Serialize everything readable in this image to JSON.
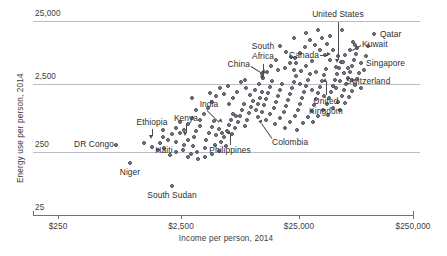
{
  "chart_data": {
    "type": "scatter",
    "title": "",
    "xlabel": "Income per person, 2014",
    "ylabel": "Energy use per person, 2014",
    "xscale": "log",
    "yscale": "log",
    "xlim": [
      250,
      250000
    ],
    "ylim": [
      25,
      25000
    ],
    "xticks": [
      "$250",
      "$2,500",
      "$25,000",
      "$250,000"
    ],
    "xtick_values": [
      250,
      2500,
      25000,
      250000
    ],
    "yticks": [
      "25",
      "250",
      "2,500",
      "25,000"
    ],
    "ytick_values": [
      25,
      250,
      2500,
      25000
    ],
    "grid": "horizontal",
    "legend": "none",
    "annotations": [
      {
        "label": "United States",
        "x": 52000,
        "y": 6800
      },
      {
        "label": "Qatar",
        "x": 130000,
        "y": 15000
      },
      {
        "label": "Kuwait",
        "x": 78000,
        "y": 9500
      },
      {
        "label": "Canada",
        "x": 43000,
        "y": 7600
      },
      {
        "label": "Singapore",
        "x": 82000,
        "y": 5000
      },
      {
        "label": "Switzerland",
        "x": 57000,
        "y": 2700
      },
      {
        "label": "South Africa",
        "x": 12500,
        "y": 2700
      },
      {
        "label": "China",
        "x": 12500,
        "y": 2200
      },
      {
        "label": "United Kingdom",
        "x": 38000,
        "y": 2900
      },
      {
        "label": "India",
        "x": 5400,
        "y": 640
      },
      {
        "label": "Ethiopia",
        "x": 1400,
        "y": 480
      },
      {
        "label": "Kenya",
        "x": 2700,
        "y": 500
      },
      {
        "label": "DR Congo",
        "x": 700,
        "y": 290
      },
      {
        "label": "Haiti",
        "x": 1650,
        "y": 390
      },
      {
        "label": "Philippines",
        "x": 6500,
        "y": 470
      },
      {
        "label": "Colombia",
        "x": 12500,
        "y": 720
      },
      {
        "label": "Niger",
        "x": 900,
        "y": 150
      },
      {
        "label": "South Sudan",
        "x": 2100,
        "y": 70
      }
    ],
    "points": [
      {
        "px": 130,
        "py": 163
      },
      {
        "px": 172,
        "py": 186
      },
      {
        "px": 116,
        "py": 145
      },
      {
        "px": 144,
        "py": 143
      },
      {
        "px": 160,
        "py": 143
      },
      {
        "px": 163,
        "py": 137
      },
      {
        "px": 163,
        "py": 130
      },
      {
        "px": 152,
        "py": 147
      },
      {
        "px": 176,
        "py": 142
      },
      {
        "px": 180,
        "py": 133
      },
      {
        "px": 188,
        "py": 140
      },
      {
        "px": 193,
        "py": 146
      },
      {
        "px": 194,
        "py": 137
      },
      {
        "px": 196,
        "py": 131
      },
      {
        "px": 200,
        "py": 126
      },
      {
        "px": 183,
        "py": 150
      },
      {
        "px": 176,
        "py": 152
      },
      {
        "px": 170,
        "py": 155
      },
      {
        "px": 188,
        "py": 157
      },
      {
        "px": 197,
        "py": 152
      },
      {
        "px": 205,
        "py": 148
      },
      {
        "px": 206,
        "py": 140
      },
      {
        "px": 209,
        "py": 133
      },
      {
        "px": 212,
        "py": 127
      },
      {
        "px": 214,
        "py": 121
      },
      {
        "px": 216,
        "py": 135
      },
      {
        "px": 219,
        "py": 129
      },
      {
        "px": 221,
        "py": 142
      },
      {
        "px": 224,
        "py": 137
      },
      {
        "px": 227,
        "py": 131
      },
      {
        "px": 229,
        "py": 125
      },
      {
        "px": 231,
        "py": 120
      },
      {
        "px": 233,
        "py": 114
      },
      {
        "px": 235,
        "py": 128
      },
      {
        "px": 238,
        "py": 122
      },
      {
        "px": 240,
        "py": 116
      },
      {
        "px": 242,
        "py": 110
      },
      {
        "px": 245,
        "py": 126
      },
      {
        "px": 247,
        "py": 120
      },
      {
        "px": 249,
        "py": 113
      },
      {
        "px": 251,
        "py": 107
      },
      {
        "px": 253,
        "py": 101
      },
      {
        "px": 232,
        "py": 134
      },
      {
        "px": 226,
        "py": 146
      },
      {
        "px": 219,
        "py": 151
      },
      {
        "px": 212,
        "py": 154
      },
      {
        "px": 205,
        "py": 157
      },
      {
        "px": 198,
        "py": 159
      },
      {
        "px": 191,
        "py": 154
      },
      {
        "px": 184,
        "py": 145
      },
      {
        "px": 215,
        "py": 145
      },
      {
        "px": 222,
        "py": 133
      },
      {
        "px": 236,
        "py": 116
      },
      {
        "px": 244,
        "py": 104
      },
      {
        "px": 256,
        "py": 110
      },
      {
        "px": 258,
        "py": 104
      },
      {
        "px": 260,
        "py": 98
      },
      {
        "px": 262,
        "py": 92
      },
      {
        "px": 264,
        "py": 105
      },
      {
        "px": 266,
        "py": 99
      },
      {
        "px": 268,
        "py": 93
      },
      {
        "px": 270,
        "py": 87
      },
      {
        "px": 272,
        "py": 81
      },
      {
        "px": 258,
        "py": 117
      },
      {
        "px": 262,
        "py": 112
      },
      {
        "px": 266,
        "py": 120
      },
      {
        "px": 270,
        "py": 114
      },
      {
        "px": 274,
        "py": 108
      },
      {
        "px": 276,
        "py": 102
      },
      {
        "px": 278,
        "py": 96
      },
      {
        "px": 280,
        "py": 90
      },
      {
        "px": 282,
        "py": 84
      },
      {
        "px": 275,
        "py": 124
      },
      {
        "px": 280,
        "py": 118
      },
      {
        "px": 284,
        "py": 112
      },
      {
        "px": 286,
        "py": 106
      },
      {
        "px": 288,
        "py": 100
      },
      {
        "px": 290,
        "py": 94
      },
      {
        "px": 292,
        "py": 88
      },
      {
        "px": 294,
        "py": 82
      },
      {
        "px": 296,
        "py": 76
      },
      {
        "px": 285,
        "py": 128
      },
      {
        "px": 290,
        "py": 122
      },
      {
        "px": 295,
        "py": 116
      },
      {
        "px": 298,
        "py": 110
      },
      {
        "px": 300,
        "py": 104
      },
      {
        "px": 302,
        "py": 98
      },
      {
        "px": 304,
        "py": 92
      },
      {
        "px": 306,
        "py": 86
      },
      {
        "px": 308,
        "py": 80
      },
      {
        "px": 310,
        "py": 74
      },
      {
        "px": 297,
        "py": 130
      },
      {
        "px": 303,
        "py": 123
      },
      {
        "px": 308,
        "py": 117
      },
      {
        "px": 312,
        "py": 111
      },
      {
        "px": 314,
        "py": 105
      },
      {
        "px": 316,
        "py": 99
      },
      {
        "px": 318,
        "py": 93
      },
      {
        "px": 320,
        "py": 87
      },
      {
        "px": 322,
        "py": 81
      },
      {
        "px": 324,
        "py": 75
      },
      {
        "px": 326,
        "py": 69
      },
      {
        "px": 313,
        "py": 122
      },
      {
        "px": 318,
        "py": 116
      },
      {
        "px": 323,
        "py": 110
      },
      {
        "px": 327,
        "py": 104
      },
      {
        "px": 329,
        "py": 98
      },
      {
        "px": 331,
        "py": 92
      },
      {
        "px": 333,
        "py": 86
      },
      {
        "px": 335,
        "py": 80
      },
      {
        "px": 337,
        "py": 74
      },
      {
        "px": 339,
        "py": 68
      },
      {
        "px": 341,
        "py": 62
      },
      {
        "px": 328,
        "py": 115
      },
      {
        "px": 333,
        "py": 108
      },
      {
        "px": 338,
        "py": 102
      },
      {
        "px": 342,
        "py": 96
      },
      {
        "px": 344,
        "py": 90
      },
      {
        "px": 346,
        "py": 84
      },
      {
        "px": 348,
        "py": 78
      },
      {
        "px": 350,
        "py": 72
      },
      {
        "px": 352,
        "py": 66
      },
      {
        "px": 354,
        "py": 60
      },
      {
        "px": 356,
        "py": 54
      },
      {
        "px": 340,
        "py": 110
      },
      {
        "px": 345,
        "py": 103
      },
      {
        "px": 349,
        "py": 97
      },
      {
        "px": 352,
        "py": 91
      },
      {
        "px": 355,
        "py": 85
      },
      {
        "px": 357,
        "py": 79
      },
      {
        "px": 359,
        "py": 73
      },
      {
        "px": 361,
        "py": 63
      },
      {
        "px": 355,
        "py": 45
      },
      {
        "px": 357,
        "py": 48
      },
      {
        "px": 353,
        "py": 42
      },
      {
        "px": 374,
        "py": 34
      },
      {
        "px": 340,
        "py": 81
      },
      {
        "px": 336,
        "py": 88
      },
      {
        "px": 330,
        "py": 60
      },
      {
        "px": 325,
        "py": 55
      },
      {
        "px": 320,
        "py": 50
      },
      {
        "px": 315,
        "py": 45
      },
      {
        "px": 310,
        "py": 40
      },
      {
        "px": 305,
        "py": 47
      },
      {
        "px": 300,
        "py": 53
      },
      {
        "px": 295,
        "py": 58
      },
      {
        "px": 290,
        "py": 63
      },
      {
        "px": 285,
        "py": 68
      },
      {
        "px": 333,
        "py": 50
      },
      {
        "px": 327,
        "py": 44
      },
      {
        "px": 322,
        "py": 38
      },
      {
        "px": 338,
        "py": 56
      },
      {
        "px": 343,
        "py": 62
      },
      {
        "px": 348,
        "py": 68
      },
      {
        "px": 312,
        "py": 61
      },
      {
        "px": 306,
        "py": 66
      },
      {
        "px": 301,
        "py": 71
      },
      {
        "px": 296,
        "py": 63
      },
      {
        "px": 291,
        "py": 57
      },
      {
        "px": 286,
        "py": 52
      },
      {
        "px": 280,
        "py": 46
      },
      {
        "px": 276,
        "py": 60
      },
      {
        "px": 271,
        "py": 66
      },
      {
        "px": 267,
        "py": 72
      },
      {
        "px": 263,
        "py": 78
      },
      {
        "px": 259,
        "py": 84
      },
      {
        "px": 255,
        "py": 90
      },
      {
        "px": 250,
        "py": 95
      },
      {
        "px": 246,
        "py": 88
      },
      {
        "px": 241,
        "py": 82
      },
      {
        "px": 237,
        "py": 92
      },
      {
        "px": 233,
        "py": 98
      },
      {
        "px": 229,
        "py": 104
      },
      {
        "px": 224,
        "py": 94
      },
      {
        "px": 220,
        "py": 88
      },
      {
        "px": 216,
        "py": 96
      },
      {
        "px": 212,
        "py": 102
      },
      {
        "px": 208,
        "py": 108
      },
      {
        "px": 204,
        "py": 114
      },
      {
        "px": 200,
        "py": 120
      },
      {
        "px": 196,
        "py": 110
      },
      {
        "px": 192,
        "py": 118
      },
      {
        "px": 188,
        "py": 124
      },
      {
        "px": 184,
        "py": 130
      },
      {
        "px": 180,
        "py": 122
      },
      {
        "px": 176,
        "py": 128
      },
      {
        "px": 172,
        "py": 134
      },
      {
        "px": 168,
        "py": 140
      },
      {
        "px": 164,
        "py": 148
      },
      {
        "px": 158,
        "py": 150
      },
      {
        "px": 192,
        "py": 98
      },
      {
        "px": 210,
        "py": 93
      },
      {
        "px": 228,
        "py": 86
      },
      {
        "px": 245,
        "py": 80
      },
      {
        "px": 262,
        "py": 74
      },
      {
        "px": 278,
        "py": 70
      },
      {
        "px": 294,
        "py": 70
      },
      {
        "px": 316,
        "py": 72
      },
      {
        "px": 300,
        "py": 84
      },
      {
        "px": 312,
        "py": 90
      },
      {
        "px": 324,
        "py": 96
      },
      {
        "px": 336,
        "py": 67
      },
      {
        "px": 344,
        "py": 73
      },
      {
        "px": 352,
        "py": 80
      },
      {
        "px": 361,
        "py": 88
      },
      {
        "px": 364,
        "py": 70
      },
      {
        "px": 366,
        "py": 56
      },
      {
        "px": 368,
        "py": 46
      },
      {
        "px": 330,
        "py": 36
      },
      {
        "px": 342,
        "py": 30
      },
      {
        "px": 318,
        "py": 30
      },
      {
        "px": 306,
        "py": 33
      },
      {
        "px": 294,
        "py": 38
      },
      {
        "px": 345,
        "py": 55
      },
      {
        "px": 350,
        "py": 50
      }
    ]
  },
  "axis": {
    "y_labels": [
      {
        "text": "25,000",
        "top": 9,
        "line_y": 21
      },
      {
        "text": "2,500",
        "top": 72,
        "line_y": 84
      },
      {
        "text": "250",
        "top": 140,
        "line_y": 152
      },
      {
        "text": "25",
        "top": 203,
        "line_y": 215
      }
    ],
    "x_labels": [
      {
        "text": "$250",
        "x": 58
      },
      {
        "text": "$2,500",
        "x": 181
      },
      {
        "text": "$25,000",
        "x": 299
      },
      {
        "text": "$250,000",
        "x": 413
      }
    ],
    "x_title": "Income per person, 2014",
    "y_title": "Energy use per person, 2014"
  },
  "labels": {
    "united_states": "United States",
    "qatar": "Qatar",
    "kuwait": "Kuwait",
    "canada": "Canada",
    "singapore": "Singapore",
    "switzerland": "Switzerland",
    "south_africa_l1": "South",
    "south_africa_l2": "Africa",
    "china": "China",
    "uk_l1": "United",
    "uk_l2": "Kingdom",
    "india": "India",
    "ethiopia": "Ethiopia",
    "kenya": "Kenya",
    "dr_congo": "DR Congo",
    "haiti": "Haiti",
    "philippines": "Philippines",
    "colombia": "Colombia",
    "niger": "Niger",
    "south_sudan": "South Sudan"
  },
  "colors": {
    "point_fill": "#7e838a",
    "point_stroke": "#4a4e54",
    "gridline": "#b9bcc0",
    "axis": "#6e7378",
    "text": "#3c3c3c"
  }
}
